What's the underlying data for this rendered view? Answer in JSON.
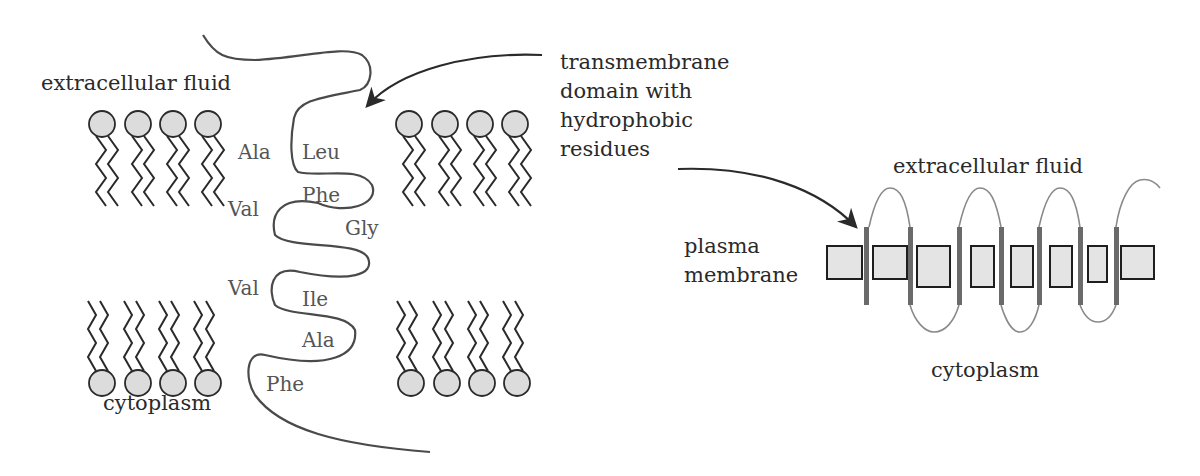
{
  "left_diagram": {
    "top_label": "extracellular fluid",
    "bottom_label": "cytoplasm",
    "residues_left_column": [
      "Ala",
      "Val",
      "Val"
    ],
    "residues_chain": [
      "Leu",
      "Phe",
      "Gly",
      "Ile",
      "Ala",
      "Phe"
    ]
  },
  "callout": {
    "lines": [
      "transmembrane",
      "domain with",
      "hydrophobic",
      "residues"
    ]
  },
  "right_diagram": {
    "top_label": "extracellular fluid",
    "side_label_lines": [
      "plasma",
      "membrane"
    ],
    "bottom_label": "cytoplasm",
    "transmembrane_segment_count": 7
  },
  "colors": {
    "head_fill": "#dcdcdc",
    "line": "#2a2a2a",
    "chain": "#4a4a4a",
    "helix_bar": "#6a6a6a",
    "loop": "#8a8a8a",
    "protein_box_fill": "#e4e4e4"
  }
}
